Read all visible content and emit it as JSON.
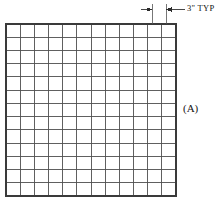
{
  "drawing": {
    "title": "Grid panel detail with typical spacing dimension",
    "background_color": "#ffffff",
    "line_color": "#4d4d4d",
    "heavy_line_color": "#333333",
    "text_color": "#141414",
    "annotations": {
      "dimension": {
        "label": "3\" TYP",
        "value": "3",
        "unit": "\"",
        "qualifier": "TYP",
        "icon": "dimension-arrow-icon",
        "description": "typical grid module spacing"
      },
      "callout": {
        "label": "(A)",
        "description": "detail callout A referencing the grid panel"
      }
    },
    "grid": {
      "columns": 12,
      "rows": 13,
      "left": 6,
      "top": 24,
      "right": 176,
      "bottom": 196,
      "cell_width": 14.17,
      "cell_height": 13.23
    },
    "dimension_geometry": {
      "extension_line_1_x": 152,
      "extension_line_2_x": 166,
      "extension_line_top": 4,
      "extension_line_bottom": 24,
      "dimension_line_y": 9.5,
      "arrow_left_tip_x": 152,
      "arrow_right_tip_x": 166
    }
  }
}
